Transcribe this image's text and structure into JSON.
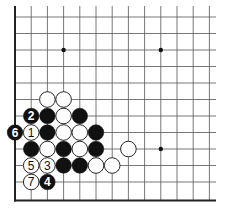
{
  "board": {
    "cols": 13,
    "rows": 12,
    "origin_x": 15,
    "origin_y": 17,
    "spacing_x": 16.2,
    "spacing_y": 16.5,
    "line_right_x": 216,
    "left_edge": true,
    "bottom_edge": true,
    "line_color": "#555555",
    "edge_color": "#222222"
  },
  "star_points": [
    {
      "col": 3,
      "row": 2
    },
    {
      "col": 9,
      "row": 2
    },
    {
      "col": 9,
      "row": 8
    }
  ],
  "stones": [
    {
      "col": 2,
      "row": 5,
      "color": "white",
      "label": ""
    },
    {
      "col": 3,
      "row": 5,
      "color": "white",
      "label": ""
    },
    {
      "col": 1,
      "row": 6,
      "color": "black",
      "label": "2"
    },
    {
      "col": 2,
      "row": 6,
      "color": "black",
      "label": ""
    },
    {
      "col": 3,
      "row": 6,
      "color": "white",
      "label": ""
    },
    {
      "col": 4,
      "row": 6,
      "color": "black",
      "label": ""
    },
    {
      "col": 0,
      "row": 7,
      "color": "black",
      "label": "6"
    },
    {
      "col": 1,
      "row": 7,
      "color": "white",
      "label": "1"
    },
    {
      "col": 2,
      "row": 7,
      "color": "black",
      "label": ""
    },
    {
      "col": 3,
      "row": 7,
      "color": "white",
      "label": ""
    },
    {
      "col": 4,
      "row": 7,
      "color": "white",
      "label": ""
    },
    {
      "col": 5,
      "row": 7,
      "color": "black",
      "label": ""
    },
    {
      "col": 1,
      "row": 8,
      "color": "black",
      "label": ""
    },
    {
      "col": 2,
      "row": 8,
      "color": "white",
      "label": ""
    },
    {
      "col": 3,
      "row": 8,
      "color": "black",
      "label": ""
    },
    {
      "col": 4,
      "row": 8,
      "color": "white",
      "label": ""
    },
    {
      "col": 5,
      "row": 8,
      "color": "black",
      "label": ""
    },
    {
      "col": 7,
      "row": 8,
      "color": "white",
      "label": ""
    },
    {
      "col": 1,
      "row": 9,
      "color": "white",
      "label": "5"
    },
    {
      "col": 2,
      "row": 9,
      "color": "white",
      "label": "3"
    },
    {
      "col": 3,
      "row": 9,
      "color": "black",
      "label": ""
    },
    {
      "col": 4,
      "row": 9,
      "color": "black",
      "label": ""
    },
    {
      "col": 5,
      "row": 9,
      "color": "white",
      "label": ""
    },
    {
      "col": 6,
      "row": 9,
      "color": "white",
      "label": ""
    },
    {
      "col": 1,
      "row": 10,
      "color": "white",
      "label": "7"
    },
    {
      "col": 2,
      "row": 10,
      "color": "black",
      "label": "4"
    }
  ]
}
